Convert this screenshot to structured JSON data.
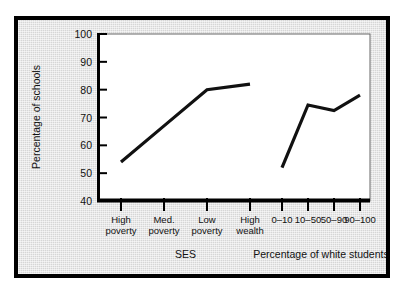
{
  "figure": {
    "frame_color": "#000000",
    "panel_color": "#d6d6d6",
    "plot_background": "#ffffff",
    "line_color": "#111111"
  },
  "chart_data": {
    "type": "line",
    "title": "",
    "subtitle": "",
    "ylabel": "Percentage of schools",
    "ylim": [
      40,
      100
    ],
    "yticks": [
      40,
      50,
      60,
      70,
      80,
      90,
      100
    ],
    "ytick_labels": [
      "40",
      "50",
      "60",
      "70",
      "80",
      "90",
      "100"
    ],
    "grid": false,
    "legend": "none",
    "panels": [
      {
        "xlabel": "SES",
        "categories": [
          "High poverty",
          "Med. poverty",
          "Low poverty",
          "High wealth"
        ],
        "category_lines": [
          [
            "High",
            "poverty"
          ],
          [
            "Med.",
            "poverty"
          ],
          [
            "Low",
            "poverty"
          ],
          [
            "High",
            "wealth"
          ]
        ],
        "values": [
          54,
          67,
          80,
          82
        ]
      },
      {
        "xlabel": "Percentage of white students",
        "categories": [
          "0–10",
          "10–50",
          "50–90",
          "90–100"
        ],
        "category_lines": [
          [
            "0–10"
          ],
          [
            "10–50"
          ],
          [
            "50–90"
          ],
          [
            "90–100"
          ]
        ],
        "values": [
          52,
          74.5,
          72.5,
          78
        ]
      }
    ]
  }
}
